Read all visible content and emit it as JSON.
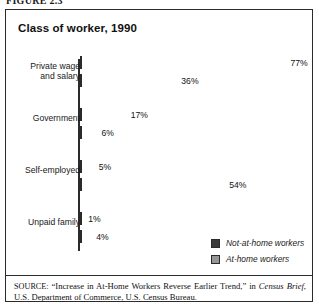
{
  "figure": {
    "label": "FIGURE 2.3"
  },
  "chart": {
    "title": "Class of worker, 1990"
  },
  "legend": {
    "items": [
      {
        "label": "Not-at-home workers",
        "color": "#3a3a3a",
        "key": "not_at_home"
      },
      {
        "label": "At-home workers",
        "color": "#969696",
        "key": "at_home"
      }
    ]
  },
  "source": {
    "prefix": "SOURCE:",
    "line1": "“Increase in At-Home Workers Reverse Earlier Trend,” in",
    "italic_title": "Census Brief",
    "line2_rest": ", U.S. Department of Commerce, U.S. Census Bureau."
  },
  "chart_data": {
    "type": "bar",
    "orientation": "horizontal",
    "title": "Class of worker, 1990",
    "xlabel": "",
    "ylabel": "",
    "xlim": [
      0,
      80
    ],
    "grid": false,
    "legend_position": "bottom-right",
    "categories": [
      "Private wage\nand salary",
      "Government",
      "Self-employed",
      "Unpaid family"
    ],
    "series": [
      {
        "name": "Not-at-home workers",
        "color": "#3a3a3a",
        "values": [
          77,
          17,
          5,
          1
        ],
        "labels": [
          "77%",
          "17%",
          "5%",
          "1%"
        ]
      },
      {
        "name": "At-home workers",
        "color": "#969696",
        "values": [
          36,
          6,
          54,
          4
        ],
        "labels": [
          "36%",
          "6%",
          "54%",
          "4%"
        ]
      }
    ]
  }
}
